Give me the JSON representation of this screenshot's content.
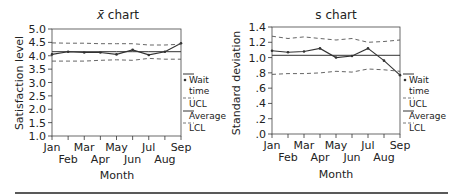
{
  "chart_data": [
    {
      "type": "line",
      "title": "x̄ chart",
      "title_symbol": "x̄",
      "title_rest": " chart",
      "xlabel": "Month",
      "ylabel": "Satisfaction level",
      "ylim": [
        1.0,
        5.0
      ],
      "yticks": [
        "1.0",
        "1.5",
        "2.0",
        "2.5",
        "3.0",
        "3.5",
        "4.0",
        "4.5",
        "5.0"
      ],
      "categories": [
        "Jan",
        "Feb",
        "Mar",
        "Apr",
        "May",
        "Jun",
        "Jul",
        "Aug",
        "Sep"
      ],
      "grid": false,
      "legend_position": "right",
      "series": [
        {
          "name": "Wait time",
          "style": "solid-markers",
          "values": [
            4.05,
            4.15,
            4.12,
            4.12,
            4.05,
            4.22,
            4.03,
            4.15,
            4.47
          ]
        },
        {
          "name": "UCL",
          "style": "dashed",
          "values": [
            4.48,
            4.47,
            4.47,
            4.45,
            4.45,
            4.45,
            4.4,
            4.4,
            4.43
          ]
        },
        {
          "name": "Average",
          "style": "solid",
          "values": [
            4.15,
            4.15,
            4.15,
            4.15,
            4.15,
            4.15,
            4.15,
            4.15,
            4.15
          ]
        },
        {
          "name": "LCL",
          "style": "dashed",
          "values": [
            3.8,
            3.8,
            3.8,
            3.83,
            3.85,
            3.83,
            3.9,
            3.87,
            3.87
          ]
        }
      ]
    },
    {
      "type": "line",
      "title": "s chart",
      "xlabel": "Month",
      "ylabel": "Standard deviation",
      "ylim": [
        0.0,
        1.4
      ],
      "yticks": [
        ".0",
        ".2",
        ".4",
        ".6",
        ".8",
        "1.0",
        "1.2",
        "1.4"
      ],
      "categories": [
        "Jan",
        "Feb",
        "Mar",
        "Apr",
        "May",
        "Jun",
        "Jul",
        "Aug",
        "Sep"
      ],
      "grid": false,
      "legend_position": "right",
      "series": [
        {
          "name": "Wait time",
          "style": "solid-markers",
          "values": [
            1.09,
            1.07,
            1.08,
            1.12,
            1.0,
            1.02,
            1.12,
            0.96,
            0.77
          ]
        },
        {
          "name": "UCL",
          "style": "dashed",
          "values": [
            1.28,
            1.25,
            1.27,
            1.25,
            1.23,
            1.25,
            1.2,
            1.21,
            1.23
          ]
        },
        {
          "name": "Average",
          "style": "solid",
          "values": [
            1.03,
            1.03,
            1.03,
            1.03,
            1.03,
            1.03,
            1.03,
            1.03,
            1.03
          ]
        },
        {
          "name": "LCL",
          "style": "dashed",
          "values": [
            0.78,
            0.79,
            0.79,
            0.8,
            0.82,
            0.81,
            0.85,
            0.84,
            0.82
          ]
        }
      ]
    }
  ],
  "legend": {
    "wait_time_line1": "Wait",
    "wait_time_line2": "time",
    "ucl": "UCL",
    "average": "Average",
    "lcl": "LCL"
  },
  "colors": {
    "line": "#333333",
    "dashed": "#555555",
    "text": "#222222"
  }
}
